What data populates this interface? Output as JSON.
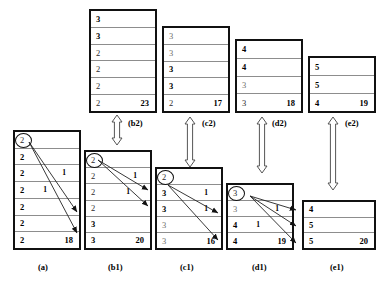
{
  "figure": {
    "type": "diagram"
  },
  "boxes": {
    "b2": {
      "caption": "(b2)",
      "total": "23",
      "rows": [
        {
          "value": "3",
          "style": "bold"
        },
        {
          "value": "3",
          "style": "bold"
        },
        {
          "value": "2",
          "style": "plain"
        },
        {
          "value": "2",
          "style": "plain"
        },
        {
          "value": "2",
          "style": "plain"
        },
        {
          "value": "2",
          "style": "plain"
        }
      ]
    },
    "c2": {
      "caption": "(c2)",
      "total": "17",
      "rows": [
        {
          "value": "3",
          "style": "gray"
        },
        {
          "value": "3",
          "style": "gray"
        },
        {
          "value": "3",
          "style": "bold"
        },
        {
          "value": "3",
          "style": "bold"
        },
        {
          "value": "2",
          "style": "plain"
        }
      ]
    },
    "d2": {
      "caption": "(d2)",
      "total": "18",
      "rows": [
        {
          "value": "4",
          "style": "bold"
        },
        {
          "value": "4",
          "style": "bold"
        },
        {
          "value": "3",
          "style": "gray"
        },
        {
          "value": "3",
          "style": "plain"
        }
      ]
    },
    "e2": {
      "caption": "(e2)",
      "total": "19",
      "rows": [
        {
          "value": "5",
          "style": "bold"
        },
        {
          "value": "5",
          "style": "bold"
        },
        {
          "value": "4",
          "style": "bold"
        }
      ]
    },
    "a": {
      "caption": "(a)",
      "total": "18",
      "circled_row": 0,
      "rows": [
        {
          "value": "2",
          "style": "plain",
          "mark": ""
        },
        {
          "value": "2",
          "style": "bold",
          "mark": ""
        },
        {
          "value": "2",
          "style": "bold",
          "mark": "1"
        },
        {
          "value": "2",
          "style": "bold",
          "mark": "1"
        },
        {
          "value": "2",
          "style": "bold",
          "mark": ""
        },
        {
          "value": "2",
          "style": "bold",
          "mark": ""
        },
        {
          "value": "2",
          "style": "bold",
          "mark": ""
        }
      ]
    },
    "b1": {
      "caption": "(b1)",
      "total": "20",
      "circled_row": 0,
      "rows": [
        {
          "value": "2",
          "style": "plain",
          "mark": ""
        },
        {
          "value": "2",
          "style": "plain",
          "mark": "1"
        },
        {
          "value": "2",
          "style": "plain",
          "mark": "1"
        },
        {
          "value": "2",
          "style": "plain",
          "mark": ""
        },
        {
          "value": "3",
          "style": "bold",
          "mark": ""
        },
        {
          "value": "3",
          "style": "bold",
          "mark": ""
        }
      ]
    },
    "c1": {
      "caption": "(c1)",
      "total": "16",
      "circled_row": 0,
      "rows": [
        {
          "value": "2",
          "style": "plain",
          "mark": ""
        },
        {
          "value": "3",
          "style": "bold",
          "mark": "1"
        },
        {
          "value": "3",
          "style": "bold",
          "mark": "1"
        },
        {
          "value": "3",
          "style": "gray",
          "mark": ""
        },
        {
          "value": "3",
          "style": "gray",
          "mark": ""
        }
      ]
    },
    "d1": {
      "caption": "(d1)",
      "total": "19",
      "circled_row": 0,
      "rows": [
        {
          "value": "3",
          "style": "plain",
          "mark": ""
        },
        {
          "value": "3",
          "style": "gray",
          "mark": "1"
        },
        {
          "value": "4",
          "style": "bold",
          "mark": "1"
        },
        {
          "value": "4",
          "style": "bold",
          "mark": ""
        }
      ]
    },
    "e1": {
      "caption": "(e1)",
      "total": "20",
      "rows": [
        {
          "value": "4",
          "style": "bold",
          "mark": ""
        },
        {
          "value": "5",
          "style": "bold",
          "mark": ""
        },
        {
          "value": "5",
          "style": "bold",
          "mark": ""
        }
      ]
    }
  },
  "colors": {
    "border": "#111111",
    "divider": "#8d8d8d",
    "gray_text": "#6e6e6e",
    "arrow_outline": "#2b2b2b",
    "background": "#ffffff"
  }
}
